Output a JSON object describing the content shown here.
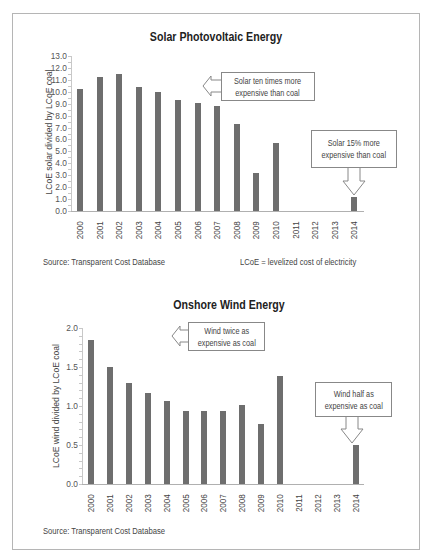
{
  "chart_data": [
    {
      "type": "bar",
      "title": "Solar Photovoltaic Energy",
      "xlabel": "",
      "ylabel": "LCoE solar divided by LCoE coal",
      "ylim": [
        0,
        13
      ],
      "yticks": [
        "13.0",
        "12.0",
        "11.0",
        "10.0",
        "9.0",
        "8.0",
        "7.0",
        "6.0",
        "5.0",
        "4.0",
        "3.0",
        "2.0",
        "1.0",
        "0.0"
      ],
      "categories": [
        "2000",
        "2001",
        "2002",
        "2003",
        "2004",
        "2005",
        "2006",
        "2007",
        "2008",
        "2009",
        "2010",
        "2011",
        "2012",
        "2013",
        "2014"
      ],
      "values": [
        10.2,
        11.2,
        11.5,
        10.4,
        10.0,
        9.3,
        9.1,
        8.8,
        7.3,
        3.2,
        5.7,
        null,
        null,
        null,
        1.15
      ],
      "grid": false,
      "annotations": [
        {
          "text_line1": "Solar ten times more",
          "text_line2": "expensive than coal"
        },
        {
          "text_line1": "Solar 15% more",
          "text_line2": "expensive than coal"
        }
      ],
      "source": "Source: Transparent Cost Database",
      "note": "LCoE = levelized cost of electricity"
    },
    {
      "type": "bar",
      "title": "Onshore Wind Energy",
      "xlabel": "",
      "ylabel": "LCoE wind divided by LCoE coal",
      "ylim": [
        0,
        2.0
      ],
      "yticks": [
        "2.0",
        "1.5",
        "1.0",
        "0.5",
        "0.0"
      ],
      "categories": [
        "2000",
        "2001",
        "2002",
        "2003",
        "2004",
        "2005",
        "2006",
        "2007",
        "2008",
        "2009",
        "2010",
        "2011",
        "2012",
        "2013",
        "2014"
      ],
      "values": [
        1.84,
        1.5,
        1.29,
        1.17,
        1.06,
        0.94,
        0.94,
        0.94,
        1.01,
        0.77,
        1.38,
        null,
        null,
        null,
        0.5
      ],
      "grid": false,
      "annotations": [
        {
          "text_line1": "Wind twice as",
          "text_line2": "expensive as coal"
        },
        {
          "text_line1": "Wind half as",
          "text_line2": "expensive as coal"
        }
      ],
      "source": "Source: Transparent Cost Database"
    }
  ],
  "colors": {
    "bar": "#6e6e6e",
    "frame": "#b5b5b5",
    "axis": "#b0b0b0"
  }
}
